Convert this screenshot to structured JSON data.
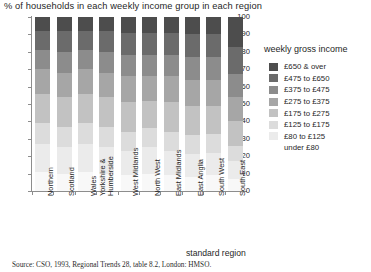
{
  "chart_title": "% of households in each weekly income group in each region",
  "source_note": "Source: CSO, 1993, Regional Trends 28, table 8.2, London: HMSO.",
  "axis": {
    "x_title": "standard region",
    "y_ticks": [
      "100",
      "90",
      "80",
      "70",
      "60",
      "50",
      "40",
      "30",
      "20",
      "10",
      "0"
    ]
  },
  "legend": {
    "title": "weekly gross income",
    "items": [
      {
        "label": "£650 & over",
        "color": "#4d4d4d"
      },
      {
        "label": "£475 to £650",
        "color": "#6b6b6b"
      },
      {
        "label": "£375 to £475",
        "color": "#8c8c8c"
      },
      {
        "label": "£275 to £375",
        "color": "#a6a6a6"
      },
      {
        "label": "£175 to £275",
        "color": "#c2c2c2"
      },
      {
        "label": "£125 to £175",
        "color": "#dcdcdc"
      },
      {
        "label": "£80 to £125",
        "color": "#ebebeb"
      },
      {
        "label": "under £80",
        "color": "#f8f8f8"
      }
    ]
  },
  "chart_data": {
    "type": "bar",
    "subtype": "stacked-bar-100pct",
    "title": "% of households in each weekly income group in each region",
    "xlabel": "standard region",
    "ylabel": "",
    "ylim": [
      0,
      100
    ],
    "ytick_step": 10,
    "grid": false,
    "legend_position": "right",
    "orientation": "vertical",
    "stack_order_bottom_to_top": [
      "under £80",
      "£80 to £125",
      "£125 to £175",
      "£175 to £275",
      "£275 to £375",
      "£375 to £475",
      "£475 to £650",
      "£650 & over"
    ],
    "categories": [
      "Northern",
      "Scotland",
      "Wales",
      "Yorkshire & Humberside",
      "West Midlands",
      "North West",
      "East Midlands",
      "East Anglia",
      "South West",
      "South East"
    ],
    "series": [
      {
        "name": "under £80",
        "color": "#f8f8f8",
        "values": [
          11,
          10,
          11,
          10,
          9,
          10,
          9,
          8,
          9,
          7
        ]
      },
      {
        "name": "£80 to £125",
        "color": "#ebebeb",
        "values": [
          16,
          15,
          16,
          15,
          14,
          15,
          14,
          13,
          13,
          10
        ]
      },
      {
        "name": "£125 to £175",
        "color": "#dcdcdc",
        "values": [
          12,
          12,
          12,
          12,
          11,
          11,
          11,
          11,
          11,
          9
        ]
      },
      {
        "name": "£175 to £275",
        "color": "#c2c2c2",
        "values": [
          17,
          17,
          17,
          17,
          17,
          16,
          17,
          17,
          16,
          14
        ]
      },
      {
        "name": "£275 to £375",
        "color": "#a6a6a6",
        "values": [
          14,
          14,
          14,
          14,
          15,
          14,
          15,
          15,
          15,
          14
        ]
      },
      {
        "name": "£375 to £475",
        "color": "#8c8c8c",
        "values": [
          11,
          12,
          11,
          12,
          12,
          12,
          12,
          13,
          13,
          13
        ]
      },
      {
        "name": "£475 to £650",
        "color": "#6b6b6b",
        "values": [
          11,
          12,
          11,
          12,
          13,
          13,
          13,
          13,
          13,
          16
        ]
      },
      {
        "name": "£650 & over",
        "color": "#4d4d4d",
        "values": [
          8,
          8,
          8,
          8,
          9,
          9,
          9,
          10,
          10,
          17
        ]
      }
    ]
  }
}
